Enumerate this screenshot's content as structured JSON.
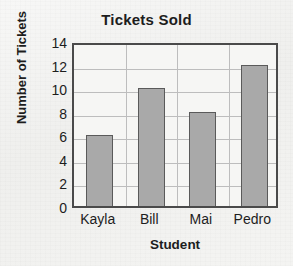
{
  "chart_data": {
    "type": "bar",
    "title": "Tickets Sold",
    "xlabel": "Student",
    "ylabel": "Number of Tickets",
    "categories": [
      "Kayla",
      "Bill",
      "Mai",
      "Pedro"
    ],
    "values": [
      6,
      10,
      8,
      12
    ],
    "ylim": [
      0,
      14
    ],
    "ytick_labels": [
      "0",
      "2",
      "4",
      "6",
      "8",
      "10",
      "12",
      "14"
    ],
    "ytick_values": [
      0,
      2,
      4,
      6,
      8,
      10,
      12,
      14
    ],
    "grid": true,
    "legend": "none",
    "colors": {
      "bar_fill": "#a9a9a9",
      "bar_border": "#5a5a5a",
      "plot_border": "#4a4a4a",
      "grid_line": "#bdbdbd",
      "background": "#f3f3f1",
      "text": "#1d1d1d"
    }
  }
}
